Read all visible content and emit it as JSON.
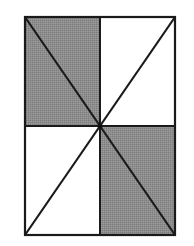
{
  "diagram": {
    "colors": {
      "background": "#ffffff",
      "shade": "#8a8a8a",
      "stroke": "#1a1a1a"
    },
    "rectangle": {
      "x1": 25,
      "y1": 17,
      "x2": 175,
      "y2": 235
    },
    "center": {
      "x": 100,
      "y": 126
    },
    "shaded_quadrants": [
      "top-left",
      "bottom-right"
    ],
    "unshaded_quadrants": [
      "top-right",
      "bottom-left"
    ],
    "diagonals": [
      "top-left to bottom-right",
      "bottom-left to top-right"
    ]
  }
}
